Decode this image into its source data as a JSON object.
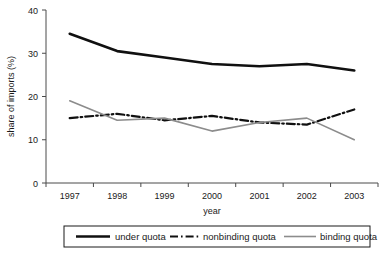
{
  "chart_data": {
    "type": "line",
    "title": "",
    "xlabel": "year",
    "ylabel": "share of imports (%)",
    "categories": [
      "1997",
      "1998",
      "1999",
      "2000",
      "2001",
      "2002",
      "2003"
    ],
    "x": [
      1997,
      1998,
      1999,
      2000,
      2001,
      2002,
      2003
    ],
    "ylim": [
      0,
      40
    ],
    "yticks": [
      0,
      10,
      20,
      30,
      40
    ],
    "ytick_labels": [
      "0",
      "10",
      "20",
      "30",
      "40"
    ],
    "grid": false,
    "legend_position": "bottom",
    "series": [
      {
        "name": "under quota",
        "values": [
          34.5,
          30.5,
          29.0,
          27.5,
          27.0,
          27.5,
          26.0
        ],
        "color": "#101010",
        "style": "solid",
        "width": 2.6
      },
      {
        "name": "nonbinding quota",
        "values": [
          15.0,
          16.0,
          14.5,
          15.5,
          14.0,
          13.5,
          17.0
        ],
        "color": "#101010",
        "style": "dash-dot",
        "width": 2.2
      },
      {
        "name": "binding quota",
        "values": [
          19.0,
          14.5,
          15.0,
          12.0,
          14.0,
          15.0,
          10.0
        ],
        "color": "#8c8c8c",
        "style": "solid",
        "width": 1.6
      }
    ]
  },
  "axis": {
    "x_title": "year",
    "y_title": "share of imports (%)"
  },
  "legend": {
    "items": [
      {
        "label": "under quota",
        "swatch": "solid-black-thick"
      },
      {
        "label": "nonbinding quota",
        "swatch": "dashdot-black"
      },
      {
        "label": "binding quota",
        "swatch": "solid-gray-thin"
      }
    ]
  }
}
